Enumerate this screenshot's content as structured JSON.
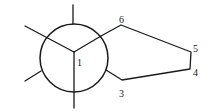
{
  "diagram": {
    "type": "newman-projection",
    "atom_labels": {
      "c1": "1",
      "c3": "3",
      "c4": "4",
      "c5": "5",
      "c6": "6"
    },
    "colors": {
      "stroke": "#1a1a1a",
      "background": "#ffffff"
    }
  }
}
